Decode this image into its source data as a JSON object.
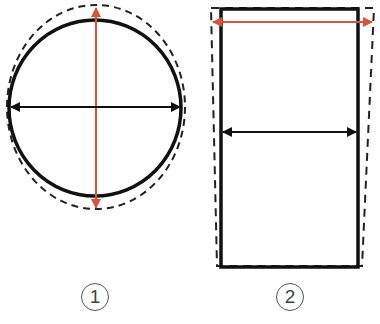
{
  "figure": {
    "colors": {
      "outline": "#111111",
      "dashed": "#222222",
      "red_arrow": "#d9533a",
      "black_arrow": "#111111",
      "label": "#444444"
    },
    "panels": [
      {
        "id": 1,
        "label": "1",
        "shape": "circle",
        "description": "Solid circle with dashed vertical ellipse; red vertical double arrow, black horizontal double arrow"
      },
      {
        "id": 2,
        "label": "2",
        "shape": "rectangle",
        "description": "Solid rectangle with dashed trapezoid widening at top; red horizontal double arrow at top, black horizontal double arrow at middle"
      }
    ]
  }
}
